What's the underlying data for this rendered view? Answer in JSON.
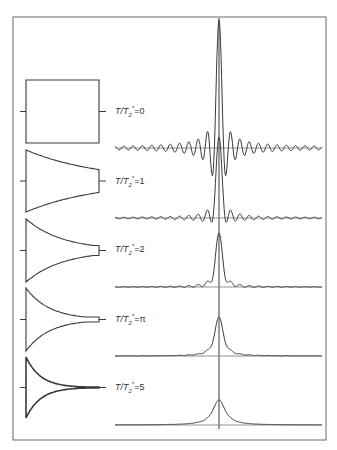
{
  "figure": {
    "frame": {
      "x1": 13,
      "y1": 17,
      "x2": 326,
      "y2": 440,
      "color": "#666666"
    },
    "center_x": 219,
    "spectrum_x_range": [
      115,
      322
    ],
    "box_x_range": [
      26,
      99
    ],
    "line_color": "#3a3a3a",
    "panels": [
      {
        "label_prefix": "T/T",
        "label_sub": "2",
        "label_sup": "*",
        "label_value": "=0",
        "ratio": 0,
        "box_top": 80,
        "box_bottom": 143,
        "box_right_half": 31.5,
        "baseline_y": 148,
        "peak_y": 20,
        "label_y": 106
      },
      {
        "label_prefix": "T/T",
        "label_sub": "2",
        "label_sup": "*",
        "label_value": "=1",
        "ratio": 1,
        "box_top": 150,
        "box_bottom": 212,
        "box_right_half": 10.5,
        "baseline_y": 218,
        "peak_y": 137,
        "label_y": 176
      },
      {
        "label_prefix": "T/T",
        "label_sub": "2",
        "label_sup": "*",
        "label_value": "=2",
        "ratio": 2,
        "box_top": 219,
        "box_bottom": 282,
        "box_right_half": 5,
        "baseline_y": 287,
        "peak_y": 233,
        "label_y": 244
      },
      {
        "label_prefix": "T/T",
        "label_sub": "2",
        "label_sup": "*",
        "label_value": "=π",
        "ratio": 3.14,
        "box_top": 288,
        "box_bottom": 351,
        "box_right_half": 2.5,
        "baseline_y": 356,
        "peak_y": 317,
        "label_y": 314
      },
      {
        "label_prefix": "T/T",
        "label_sub": "2",
        "label_sup": "*",
        "label_value": "=5",
        "ratio": 5,
        "box_top": 357,
        "box_bottom": 418,
        "box_right_half": 0.5,
        "baseline_y": 425,
        "peak_y": 400,
        "label_y": 382
      }
    ]
  }
}
